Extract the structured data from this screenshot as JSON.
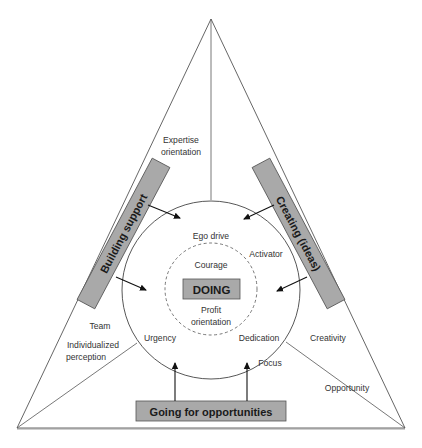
{
  "diagram": {
    "type": "triangle-circle-model",
    "center_label": "DOING",
    "side_boxes": {
      "left": "Building support",
      "right": "Creating (ideas)",
      "bottom": "Going for opportunities"
    },
    "labels": {
      "expertise_line1": "Expertise",
      "expertise_line2": "orientation",
      "ego_drive": "Ego drive",
      "activator": "Activator",
      "courage": "Courage",
      "profit_line1": "Profit",
      "profit_line2": "orientation",
      "urgency": "Urgency",
      "dedication": "Dedication",
      "focus": "Focus",
      "team": "Team",
      "individualized_line1": "Individualized",
      "individualized_line2": "perception",
      "creativity": "Creativity",
      "opportunity": "Opportunity"
    },
    "colors": {
      "box_fill": "#a9a9a9",
      "box_stroke": "#555555",
      "line": "#444444",
      "text": "#333333"
    }
  }
}
